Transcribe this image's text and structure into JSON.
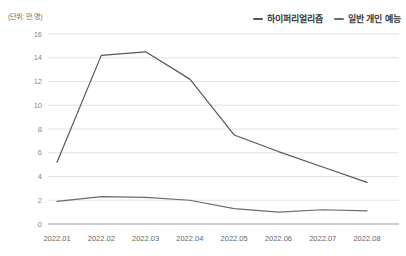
{
  "chart_data": {
    "type": "line",
    "title": "",
    "xlabel": "",
    "ylabel": "(단위: 만 명)",
    "categories": [
      "2022.01",
      "2022.02",
      "2022.03",
      "2022.04",
      "2022.05",
      "2022.06",
      "2022.07",
      "2022.08"
    ],
    "series": [
      {
        "name": "하이퍼리얼리즘",
        "values": [
          5.2,
          14.2,
          14.5,
          12.2,
          7.5,
          6.1,
          4.8,
          3.5
        ],
        "color": "#565759"
      },
      {
        "name": "일반 개인 예능",
        "values": [
          1.9,
          2.3,
          2.25,
          2.0,
          1.3,
          1.0,
          1.2,
          1.1
        ],
        "color": "#6a6b6d"
      }
    ],
    "ylim": [
      0,
      16
    ],
    "yticks": [
      0,
      2,
      4,
      6,
      8,
      10,
      12,
      14,
      16
    ],
    "grid": true,
    "legend_position": "top-right",
    "grid_color": "#e3e3e3",
    "axis_color": "#9c9c9c",
    "ytick_label_color": "#8a8a8a",
    "xtick_label_color": "#666666"
  }
}
